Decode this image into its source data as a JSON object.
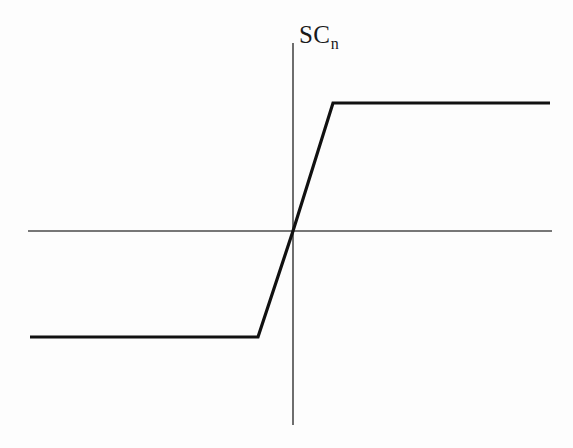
{
  "figure": {
    "background_color": "#fdfdfd",
    "width": 573,
    "height": 448
  },
  "labels": {
    "y_axis_base": "SC",
    "y_axis_subscript": "n"
  },
  "colors": {
    "axis": "#4a4a4a",
    "curve": "#111111",
    "text": "#1a1a1a",
    "background": "#fdfdfd"
  },
  "chart_data": {
    "type": "line",
    "title": "",
    "xlabel": "",
    "ylabel": "SC_n",
    "grid": false,
    "legend": false,
    "axes": {
      "x_axis": {
        "x_start_px": 28,
        "x_end_px": 552,
        "y_px": 231
      },
      "y_axis": {
        "y_start_px": 43,
        "y_end_px": 425,
        "x_px": 293
      },
      "origin_px": {
        "x": 293,
        "y": 231
      }
    },
    "x": [
      30,
      258,
      293,
      333,
      550
    ],
    "y_px": [
      337,
      337,
      231,
      103,
      103
    ],
    "series": [
      {
        "name": "SC_n",
        "points_px": [
          {
            "x": 30,
            "y": 337
          },
          {
            "x": 258,
            "y": 337
          },
          {
            "x": 293,
            "y": 231
          },
          {
            "x": 333,
            "y": 103
          },
          {
            "x": 550,
            "y": 103
          }
        ],
        "normalized_points": [
          {
            "x": -1.0,
            "y": -1.0
          },
          {
            "x": -0.435,
            "y": -1.0
          },
          {
            "x": 0.0,
            "y": 0.0
          },
          {
            "x": 0.155,
            "y": 1.0
          },
          {
            "x": 1.0,
            "y": 1.0
          }
        ]
      }
    ],
    "saturation": {
      "lower_plateau_y_px": 337,
      "upper_plateau_y_px": 103,
      "lower_knee_x_px": 258,
      "upper_knee_x_px": 333
    },
    "line_widths": {
      "axis_px": 1.6,
      "curve_px": 3.2
    }
  }
}
